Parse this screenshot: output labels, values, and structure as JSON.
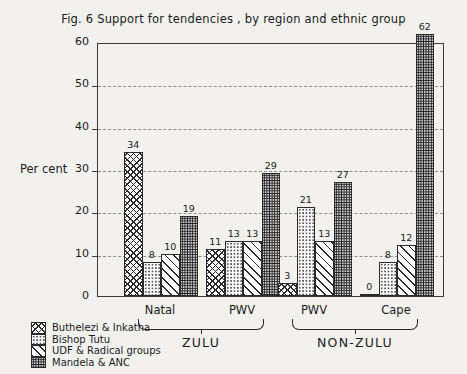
{
  "chart_data": {
    "type": "bar",
    "title": "Fig. 6  Support for tendencies , by region and ethnic group",
    "xlabel": "",
    "ylabel": "Per cent",
    "ylim": [
      0,
      60
    ],
    "yticks": [
      0,
      10,
      20,
      30,
      40,
      50,
      60
    ],
    "grid": "horizontal-dashed",
    "legend_position": "bottom-left-outside",
    "categories": [
      "Natal",
      "PWV",
      "PWV",
      "Cape"
    ],
    "super_categories": [
      {
        "label": "ZULU",
        "covers": [
          "Natal",
          "PWV"
        ]
      },
      {
        "label": "NON-ZULU",
        "covers": [
          "PWV",
          "Cape"
        ]
      }
    ],
    "series": [
      {
        "name": "Buthelezi & Inkatha",
        "pattern": "cross-hatch",
        "values": [
          34,
          11,
          3,
          0
        ]
      },
      {
        "name": "Bishop Tutu",
        "pattern": "light-dots",
        "values": [
          8,
          13,
          21,
          8
        ]
      },
      {
        "name": "UDF & Radical groups",
        "pattern": "diagonal-lines",
        "values": [
          10,
          13,
          13,
          12
        ]
      },
      {
        "name": "Mandela & ANC",
        "pattern": "dense-stipple",
        "values": [
          19,
          29,
          27,
          62
        ]
      }
    ]
  },
  "legend": {
    "items": [
      {
        "label": "Buthelezi & Inkatha",
        "pattern": "cross-hatch"
      },
      {
        "label": "Bishop Tutu",
        "pattern": "light-dots"
      },
      {
        "label": "UDF & Radical groups",
        "pattern": "diagonal-lines"
      },
      {
        "label": "Mandela & ANC",
        "pattern": "dense-stipple"
      }
    ]
  },
  "colors": {
    "background": "#f2f1ee",
    "axis": "#3a3a3a",
    "grid": "#8d8d8d",
    "ink": "#1b1b1b"
  }
}
